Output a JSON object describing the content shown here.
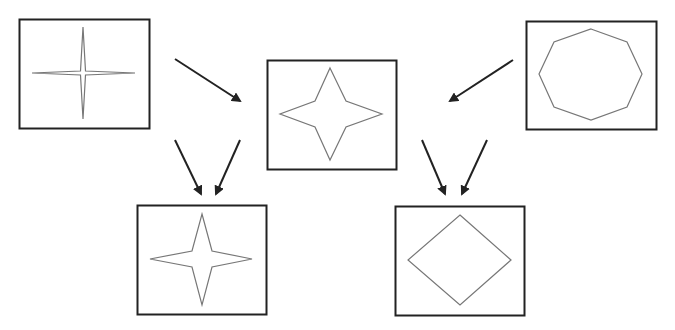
{
  "diagram": {
    "colors": {
      "box_stroke": "#222222",
      "shape_stroke": "#777777",
      "arrow": "#222222",
      "background": "#ffffff"
    },
    "nodes": [
      {
        "id": "source-left",
        "shape": "thin-four-point-star",
        "box": [
          19,
          19,
          130,
          109
        ]
      },
      {
        "id": "intermediate",
        "shape": "four-point-star",
        "box": [
          267,
          60,
          129,
          109
        ]
      },
      {
        "id": "source-right",
        "shape": "octagon",
        "box": [
          526,
          21,
          130,
          108
        ]
      },
      {
        "id": "result-left",
        "shape": "four-point-star",
        "box": [
          137,
          205,
          129,
          109
        ]
      },
      {
        "id": "result-right",
        "shape": "diamond",
        "box": [
          395,
          206,
          129,
          109
        ]
      }
    ],
    "edges": [
      {
        "from": "source-left",
        "to": "intermediate"
      },
      {
        "from": "source-right",
        "to": "intermediate"
      },
      {
        "from": "source-left",
        "to": "result-left"
      },
      {
        "from": "intermediate",
        "to": "result-left"
      },
      {
        "from": "intermediate",
        "to": "result-right"
      },
      {
        "from": "source-right",
        "to": "result-right"
      }
    ]
  }
}
